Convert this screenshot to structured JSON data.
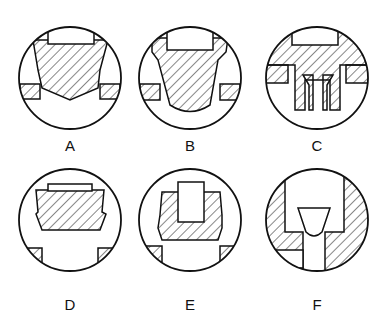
{
  "figure": {
    "panels": [
      {
        "id": "A",
        "label": "A"
      },
      {
        "id": "B",
        "label": "B"
      },
      {
        "id": "C",
        "label": "C"
      },
      {
        "id": "D",
        "label": "D"
      },
      {
        "id": "E",
        "label": "E"
      },
      {
        "id": "F",
        "label": "F"
      }
    ],
    "colors": {
      "stroke": "#111111",
      "background": "#ffffff"
    }
  }
}
